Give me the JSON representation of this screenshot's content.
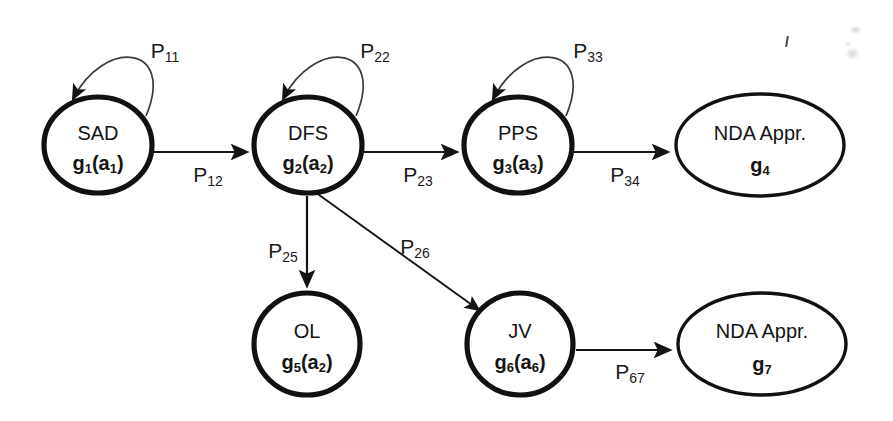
{
  "diagram": {
    "type": "state-transition-markov-chain",
    "stroke_color": "#141414",
    "background_color": "#ffffff",
    "nodes": [
      {
        "id": "n1",
        "name": "SAD",
        "sub_base": "g",
        "sub_index": "1",
        "sub_arg": "a",
        "sub_arg_index": "1",
        "shape": "circle",
        "cx": 98,
        "cy": 145,
        "rx": 54,
        "ry": 48,
        "weight": "thick"
      },
      {
        "id": "n2",
        "name": "DFS",
        "sub_base": "g",
        "sub_index": "2",
        "sub_arg": "a",
        "sub_arg_index": "2",
        "shape": "circle",
        "cx": 308,
        "cy": 145,
        "rx": 54,
        "ry": 48,
        "weight": "thick"
      },
      {
        "id": "n3",
        "name": "PPS",
        "sub_base": "g",
        "sub_index": "3",
        "sub_arg": "a",
        "sub_arg_index": "3",
        "shape": "circle",
        "cx": 518,
        "cy": 145,
        "rx": 54,
        "ry": 48,
        "weight": "thick"
      },
      {
        "id": "n4",
        "name": "NDA Appr.",
        "sub_base": "g",
        "sub_index": "4",
        "sub_arg": "",
        "sub_arg_index": "",
        "shape": "ellipse",
        "cx": 760,
        "cy": 145,
        "rx": 84,
        "ry": 51,
        "weight": "thin"
      },
      {
        "id": "n5",
        "name": "OL",
        "sub_base": "g",
        "sub_index": "5",
        "sub_arg": "a",
        "sub_arg_index": "2",
        "shape": "circle",
        "cx": 307,
        "cy": 344,
        "rx": 53,
        "ry": 51,
        "weight": "thick"
      },
      {
        "id": "n6",
        "name": "JV",
        "sub_base": "g",
        "sub_index": "6",
        "sub_arg": "a",
        "sub_arg_index": "6",
        "shape": "circle",
        "cx": 520,
        "cy": 344,
        "rx": 53,
        "ry": 51,
        "weight": "thick"
      },
      {
        "id": "n7",
        "name": "NDA Appr.",
        "sub_base": "g",
        "sub_index": "7",
        "sub_arg": "",
        "sub_arg_index": "",
        "shape": "ellipse",
        "cx": 762,
        "cy": 344,
        "rx": 84,
        "ry": 51,
        "weight": "thin"
      }
    ],
    "edges": [
      {
        "id": "e11",
        "from": "n1",
        "to": "n1",
        "label_base": "P",
        "label_sub": "11",
        "kind": "self-loop",
        "label_x": 165,
        "label_y": 52
      },
      {
        "id": "e22",
        "from": "n2",
        "to": "n2",
        "label_base": "P",
        "label_sub": "22",
        "kind": "self-loop",
        "label_x": 375,
        "label_y": 52
      },
      {
        "id": "e33",
        "from": "n3",
        "to": "n3",
        "label_base": "P",
        "label_sub": "33",
        "kind": "self-loop",
        "label_x": 588,
        "label_y": 52
      },
      {
        "id": "e12",
        "from": "n1",
        "to": "n2",
        "label_base": "P",
        "label_sub": "12",
        "kind": "straight",
        "label_x": 208,
        "label_y": 173
      },
      {
        "id": "e23",
        "from": "n2",
        "to": "n3",
        "label_base": "P",
        "label_sub": "23",
        "kind": "straight",
        "label_x": 418,
        "label_y": 173
      },
      {
        "id": "e34",
        "from": "n3",
        "to": "n4",
        "label_base": "P",
        "label_sub": "34",
        "kind": "straight",
        "label_x": 625,
        "label_y": 173
      },
      {
        "id": "e25",
        "from": "n2",
        "to": "n5",
        "label_base": "P",
        "label_sub": "25",
        "kind": "vertical",
        "label_x": 283,
        "label_y": 252
      },
      {
        "id": "e26",
        "from": "n2",
        "to": "n6",
        "label_base": "P",
        "label_sub": "26",
        "kind": "diagonal",
        "label_x": 415,
        "label_y": 248
      },
      {
        "id": "e67",
        "from": "n6",
        "to": "n7",
        "label_base": "P",
        "label_sub": "67",
        "kind": "straight",
        "label_x": 630,
        "label_y": 370
      }
    ]
  }
}
